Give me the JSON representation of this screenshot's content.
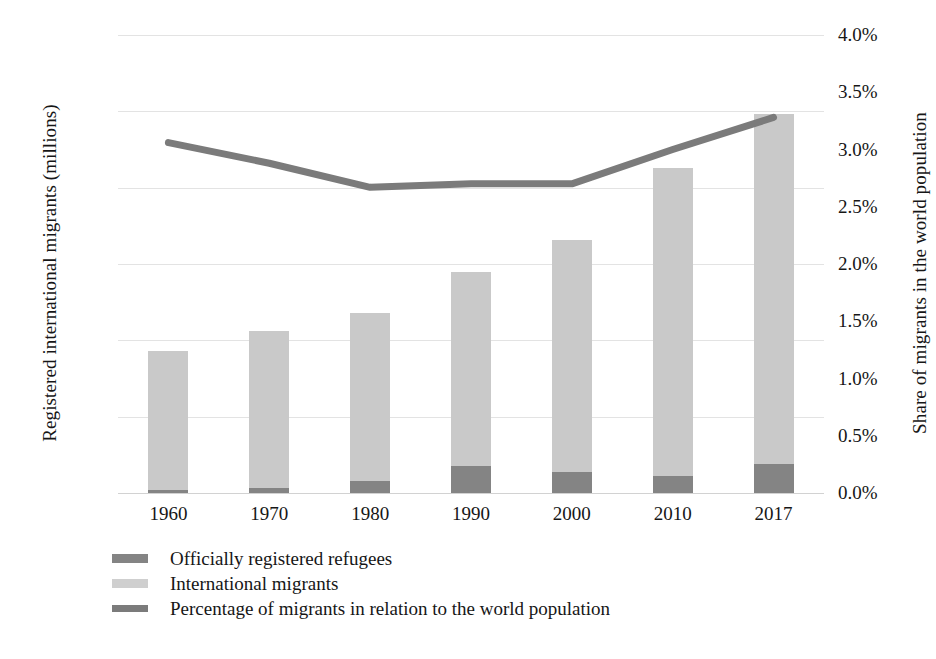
{
  "chart_data": {
    "type": "bar",
    "title": "",
    "subtitle": "",
    "categories": [
      "1960",
      "1970",
      "1980",
      "1990",
      "2000",
      "2010",
      "2017"
    ],
    "xlabel": "",
    "ylabel": "Registered international migrants (millions)",
    "y2label": "Share of migrants in the world population",
    "ylim": [
      0,
      300
    ],
    "y2lim": [
      0,
      4.0
    ],
    "yticks": [
      "0",
      "50",
      "100",
      "150",
      "200",
      "250",
      "300"
    ],
    "ytick_values": [
      0,
      50,
      100,
      150,
      200,
      250,
      300
    ],
    "y2ticks": [
      "0.0%",
      "0.5%",
      "1.0%",
      "1.5%",
      "2.0%",
      "2.5%",
      "3.0%",
      "3.5%",
      "4.0%"
    ],
    "y2tick_values": [
      0.0,
      0.5,
      1.0,
      1.5,
      2.0,
      2.5,
      3.0,
      3.5,
      4.0
    ],
    "grid": true,
    "legend_position": "bottom-left",
    "stacked": true,
    "series": [
      {
        "name": "Officially registered refugees",
        "type": "bar",
        "axis": "left",
        "color": "#848484",
        "values": [
          2,
          3,
          8,
          18,
          14,
          11,
          19
        ]
      },
      {
        "name": "International migrants",
        "type": "bar",
        "axis": "left",
        "color": "#c9c9c9",
        "values": [
          91,
          103,
          110,
          127,
          152,
          202,
          229
        ]
      },
      {
        "name": "Percentage of migrants in relation to the world population",
        "type": "line",
        "axis": "right",
        "color": "#7b7b7b",
        "values": [
          3.06,
          2.88,
          2.67,
          2.7,
          2.7,
          3.0,
          3.28
        ]
      }
    ],
    "totals": [
      93,
      106,
      118,
      145,
      166,
      213,
      248
    ]
  },
  "legend": {
    "items": [
      {
        "label": "Officially registered refugees",
        "swatch": "refugees"
      },
      {
        "label": "International migrants",
        "swatch": "migrants"
      },
      {
        "label": "Percentage of migrants in relation to the world population",
        "swatch": "pct"
      }
    ]
  }
}
